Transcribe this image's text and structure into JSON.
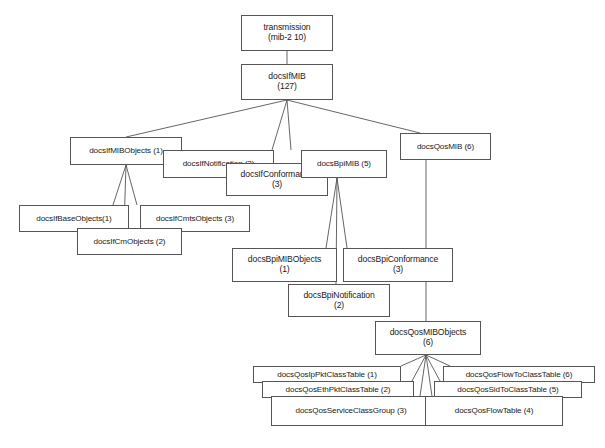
{
  "diagram": {
    "background_color": "#ffffff",
    "stroke_color": "#555555",
    "text_color": "#1a1a1a",
    "nodes": [
      {
        "id": "transmission",
        "line1": "transmission",
        "line2": "(mib-2 10)",
        "x": 241,
        "y": 15,
        "w": 92,
        "h": 36
      },
      {
        "id": "docsIfMIB",
        "line1": "docsIfMIB",
        "line2": "(127)",
        "x": 241,
        "y": 64,
        "w": 92,
        "h": 36
      },
      {
        "id": "docsIfMIBObjects",
        "line1": "docsIfMIBObjects (1)",
        "line2": "",
        "x": 70,
        "y": 137,
        "w": 112,
        "h": 28
      },
      {
        "id": "docsIfNotification",
        "line1": "docsIfNotification (2)",
        "line2": "",
        "x": 163,
        "y": 150,
        "w": 111,
        "h": 28
      },
      {
        "id": "docsIfConformance",
        "line1": "docsIfConformance",
        "line2": "(3)",
        "x": 226,
        "y": 163,
        "w": 102,
        "h": 33
      },
      {
        "id": "docsBpiMIB",
        "line1": "docsBpiMIB (5)",
        "line2": "",
        "x": 301,
        "y": 150,
        "w": 86,
        "h": 28
      },
      {
        "id": "docsQosMIB",
        "line1": "docsQosMIB (6)",
        "line2": "",
        "x": 400,
        "y": 133,
        "w": 91,
        "h": 27
      },
      {
        "id": "docsIfBaseObjects",
        "line1": "docsIfBaseObjects(1)",
        "line2": "",
        "x": 19,
        "y": 205,
        "w": 110,
        "h": 27
      },
      {
        "id": "docsIfCmtsObjects",
        "line1": "docsIfCmtsObjects (3)",
        "line2": "",
        "x": 140,
        "y": 205,
        "w": 110,
        "h": 27
      },
      {
        "id": "docsIfCmObjects",
        "line1": "docsIfCmObjects (2)",
        "line2": "",
        "x": 77,
        "y": 228,
        "w": 105,
        "h": 27
      },
      {
        "id": "docsBpiMIBObjects",
        "line1": "docsBpiMIBObjects",
        "line2": "(1)",
        "x": 232,
        "y": 248,
        "w": 105,
        "h": 34
      },
      {
        "id": "docsBpiConformance",
        "line1": "docsBpiConformance",
        "line2": "(3)",
        "x": 343,
        "y": 248,
        "w": 110,
        "h": 34
      },
      {
        "id": "docsBpiNotification",
        "line1": "docsBpiNotification",
        "line2": "(2)",
        "x": 288,
        "y": 284,
        "w": 102,
        "h": 33
      },
      {
        "id": "docsQosMIBObjects",
        "line1": "docsQosMIBObjects",
        "line2": "(6)",
        "x": 375,
        "y": 321,
        "w": 106,
        "h": 34
      },
      {
        "id": "docsQosIpPktClassTable",
        "line1": "docsQosIpPktClassTable (1)",
        "line2": "",
        "x": 253,
        "y": 366,
        "w": 148,
        "h": 17
      },
      {
        "id": "docsQosEthPktClassTable",
        "line1": "docsQosEthPktClassTable (2)",
        "line2": "",
        "x": 262,
        "y": 381,
        "w": 152,
        "h": 17
      },
      {
        "id": "docsQosServiceClassGroup",
        "line1": "docsQosServiceClassGroup (3)",
        "line2": "",
        "x": 271,
        "y": 396,
        "w": 160,
        "h": 30
      },
      {
        "id": "docsQosFlowToClassTable",
        "line1": "docsQosFlowToClassTable (6)",
        "line2": "",
        "x": 443,
        "y": 366,
        "w": 152,
        "h": 17
      },
      {
        "id": "docsQosSidToClassTable",
        "line1": "docsQosSidToClassTable (5)",
        "line2": "",
        "x": 434,
        "y": 381,
        "w": 148,
        "h": 17
      },
      {
        "id": "docsQosFlowTable",
        "line1": "docsQosFlowTable (4)",
        "line2": "",
        "x": 425,
        "y": 396,
        "w": 138,
        "h": 30
      }
    ],
    "edges": [
      {
        "from": "transmission",
        "to": "docsIfMIB",
        "points": "287,51 287,64"
      },
      {
        "from": "docsIfMIB",
        "to": "docsIfMIBObjects",
        "points": "287,100 126,137"
      },
      {
        "from": "docsIfMIB",
        "to": "docsIfNotification",
        "points": "287,100 272,150"
      },
      {
        "from": "docsIfMIB",
        "to": "docsBpiMIB",
        "points": "287,100 291,150"
      },
      {
        "from": "docsIfMIB",
        "to": "docsQosMIB",
        "points": "287,100 420,133"
      },
      {
        "from": "docsIfMIBObjects",
        "to": "docsIfBaseObjects",
        "points": "126,165 113,205"
      },
      {
        "from": "docsIfMIBObjects",
        "to": "docsIfCmObjects",
        "points": "126,165 124,228"
      },
      {
        "from": "docsIfMIBObjects",
        "to": "docsIfCmtsObjects",
        "points": "126,165 137,205"
      },
      {
        "from": "docsBpiMIB",
        "to": "docsBpiMIBObjects",
        "points": "337,178 326,248"
      },
      {
        "from": "docsBpiMIB",
        "to": "docsBpiNotification",
        "points": "337,178 336,284"
      },
      {
        "from": "docsBpiMIB",
        "to": "docsBpiConformance",
        "points": "337,178 347,248"
      },
      {
        "from": "docsQosMIB",
        "to": "docsQosMIBObjects",
        "points": "426,160 426,321"
      },
      {
        "from": "docsQosMIBObjects",
        "to": "docsQosIpPktClassTable",
        "points": "426,355 401,366"
      },
      {
        "from": "docsQosMIBObjects",
        "to": "docsQosEthPktClassTable",
        "points": "426,355 412,381"
      },
      {
        "from": "docsQosMIBObjects",
        "to": "docsQosServiceClassGroup",
        "points": "426,355 420,396"
      },
      {
        "from": "docsQosMIBObjects",
        "to": "docsQosFlowTable",
        "points": "426,355 432,396"
      },
      {
        "from": "docsQosMIBObjects",
        "to": "docsQosSidToClassTable",
        "points": "426,355 440,381"
      },
      {
        "from": "docsQosMIBObjects",
        "to": "docsQosFlowToClassTable",
        "points": "426,355 450,366"
      }
    ]
  }
}
